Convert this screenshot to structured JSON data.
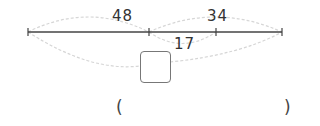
{
  "diagram": {
    "segment_labels": {
      "total_left": "48",
      "total_right": "34",
      "overlap": "17"
    },
    "answer_box": "",
    "answer_parentheses": {
      "open": "(",
      "close": ")",
      "value": ""
    },
    "colors": {
      "line": "#444444",
      "arc": "#d9d9d9",
      "text": "#333333"
    }
  }
}
